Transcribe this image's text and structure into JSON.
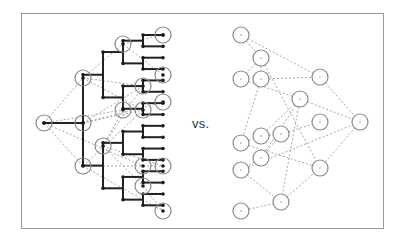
{
  "figure": {
    "separator_label": "vs.",
    "colors": {
      "frame": "#9a9a9a",
      "tree_edge": "#222222",
      "dashed_edge": "#a8a8a8",
      "circle": "#8a8a8a",
      "dot": "#1a1a1a"
    }
  },
  "left_graph": {
    "description": "hierarchical binary tree with highlighted nodes and dashed cross-links",
    "root": [
      44,
      123
    ],
    "level_x": [
      44,
      83,
      103,
      123,
      143,
      163
    ],
    "leaf_y_range": [
      35,
      211
    ],
    "leaf_count": 32,
    "highlighted_nodes": [
      [
        44,
        123
      ],
      [
        83,
        123
      ],
      [
        83,
        78
      ],
      [
        83,
        166
      ],
      [
        103,
        146
      ],
      [
        123,
        44
      ],
      [
        143,
        86
      ],
      [
        123,
        110
      ],
      [
        143,
        110
      ],
      [
        163,
        35
      ],
      [
        163,
        75
      ],
      [
        163,
        102
      ],
      [
        143,
        166
      ],
      [
        163,
        166
      ],
      [
        143,
        186
      ],
      [
        163,
        211
      ]
    ],
    "dashed_edges": [
      [
        [
          44,
          123
        ],
        [
          83,
          78
        ]
      ],
      [
        [
          44,
          123
        ],
        [
          83,
          166
        ]
      ],
      [
        [
          44,
          123
        ],
        [
          123,
          110
        ]
      ],
      [
        [
          44,
          123
        ],
        [
          143,
          166
        ]
      ],
      [
        [
          83,
          78
        ],
        [
          123,
          44
        ]
      ],
      [
        [
          83,
          78
        ],
        [
          143,
          86
        ]
      ],
      [
        [
          83,
          78
        ],
        [
          143,
          110
        ]
      ],
      [
        [
          123,
          44
        ],
        [
          163,
          35
        ]
      ],
      [
        [
          123,
          44
        ],
        [
          163,
          75
        ]
      ],
      [
        [
          83,
          123
        ],
        [
          143,
          86
        ]
      ],
      [
        [
          83,
          123
        ],
        [
          143,
          110
        ]
      ],
      [
        [
          83,
          123
        ],
        [
          163,
          102
        ]
      ],
      [
        [
          103,
          146
        ],
        [
          143,
          86
        ]
      ],
      [
        [
          103,
          146
        ],
        [
          163,
          166
        ]
      ],
      [
        [
          103,
          146
        ],
        [
          143,
          186
        ]
      ],
      [
        [
          83,
          166
        ],
        [
          143,
          110
        ]
      ],
      [
        [
          83,
          166
        ],
        [
          163,
          166
        ]
      ],
      [
        [
          83,
          166
        ],
        [
          163,
          211
        ]
      ],
      [
        [
          143,
          186
        ],
        [
          163,
          211
        ]
      ],
      [
        [
          103,
          146
        ],
        [
          123,
          110
        ]
      ]
    ]
  },
  "right_graph": {
    "description": "unstructured graph with the same nodes, dashed edges only",
    "nodes": [
      [
        241,
        35
      ],
      [
        261,
        58
      ],
      [
        241,
        79
      ],
      [
        261,
        79
      ],
      [
        320,
        77
      ],
      [
        300,
        99
      ],
      [
        320,
        122
      ],
      [
        360,
        122
      ],
      [
        241,
        143
      ],
      [
        261,
        136
      ],
      [
        281,
        134
      ],
      [
        261,
        158
      ],
      [
        241,
        170
      ],
      [
        320,
        168
      ],
      [
        281,
        202
      ],
      [
        241,
        211
      ]
    ],
    "edges": [
      [
        0,
        1
      ],
      [
        0,
        4
      ],
      [
        1,
        2
      ],
      [
        1,
        3
      ],
      [
        1,
        13
      ],
      [
        3,
        4
      ],
      [
        3,
        8
      ],
      [
        2,
        5
      ],
      [
        4,
        7
      ],
      [
        5,
        7
      ],
      [
        5,
        9
      ],
      [
        5,
        11
      ],
      [
        5,
        14
      ],
      [
        10,
        6
      ],
      [
        9,
        10
      ],
      [
        8,
        13
      ],
      [
        12,
        7
      ],
      [
        12,
        14
      ],
      [
        14,
        13
      ],
      [
        15,
        14
      ],
      [
        13,
        7
      ],
      [
        11,
        12
      ],
      [
        8,
        9
      ],
      [
        10,
        11
      ]
    ]
  }
}
